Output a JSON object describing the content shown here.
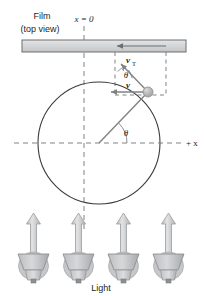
{
  "figure": {
    "title_line1": "Film",
    "title_line2": "(top view)",
    "origin_label": "x = 0",
    "axis_label": "+ x",
    "light_label": "Light",
    "velocity_label": "v",
    "velocity_tangential_label": "v",
    "velocity_tangential_sub": "T",
    "angle_label_center": "θ",
    "angle_label_particle": "θ",
    "colors": {
      "film_fill": "#d9d9d9",
      "film_stroke": "#6d6e71",
      "ink": "#231f20",
      "dashed": "#808285",
      "vector": "#808285",
      "lamp_fill": "#c9cacb",
      "lamp_stroke": "#929497",
      "arrow_fill": "#d5d6d7",
      "particle_fill": "#b3b5b7"
    },
    "geometry": {
      "circle_center_x": 99,
      "circle_center_y": 143,
      "circle_radius": 61,
      "particle_x": 148,
      "particle_y": 92,
      "film_left": 22,
      "film_right": 186,
      "film_top": 40,
      "film_bottom": 52,
      "axis_y": 143,
      "vertical_dash_x": 84,
      "lamp_count": 4
    }
  }
}
